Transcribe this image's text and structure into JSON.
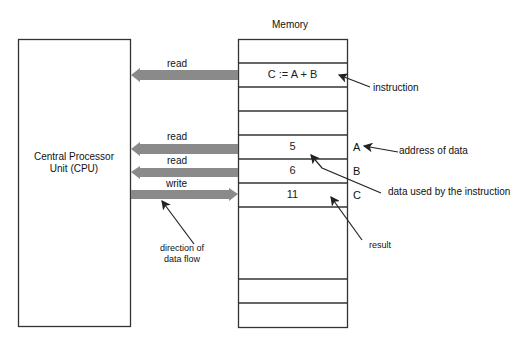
{
  "diagram": {
    "memory_title": "Memory",
    "cpu": {
      "line1": "Central Processor",
      "line2": "Unit (CPU)"
    },
    "arrows": [
      {
        "label": "read",
        "direction": "to-cpu"
      },
      {
        "label": "read",
        "direction": "to-cpu"
      },
      {
        "label": "read",
        "direction": "to-cpu"
      },
      {
        "label": "write",
        "direction": "to-memory"
      }
    ],
    "memory_cells": [
      {
        "content": ""
      },
      {
        "content": "C := A + B"
      },
      {
        "content": ""
      },
      {
        "content": ""
      },
      {
        "content": "5",
        "address": "A"
      },
      {
        "content": "6",
        "address": "B"
      },
      {
        "content": "11",
        "address": "C"
      },
      {
        "content": ""
      },
      {
        "content": ""
      },
      {
        "content": ""
      }
    ],
    "annotations": {
      "instruction": "instruction",
      "address_of_data": "address of data",
      "data_used": "data used by the instruction",
      "result": "result",
      "direction_line1": "direction of",
      "direction_line2": "data flow"
    },
    "colors": {
      "arrow_fill": "#8a8a8a",
      "border": "#333333"
    }
  }
}
